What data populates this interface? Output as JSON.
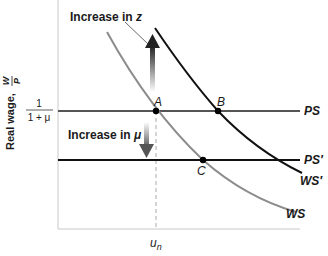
{
  "diagram": {
    "type": "wage-setting / price-setting equilibrium",
    "y_axis": {
      "label": "Real wage,",
      "fraction_num": "W",
      "fraction_den": "P"
    },
    "y_tick": {
      "num": "1",
      "den": "1 + μ"
    },
    "x_tick": {
      "main": "u",
      "sub": "n"
    },
    "curves": {
      "ps": "PS",
      "ps_prime": "PS′",
      "ws": "WS",
      "ws_prime": "WS′"
    },
    "points": {
      "a": "A",
      "b": "B",
      "c": "C"
    },
    "annotations": {
      "increase_z_text": "Increase in ",
      "increase_z_var": "z",
      "increase_mu_text": "Increase in ",
      "increase_mu_var": "μ"
    },
    "colors": {
      "ws_curve": "#8c8c8c",
      "ws_prime_curve": "#111111",
      "ps_line": "#555555",
      "ps_prime_line": "#111111",
      "axis": "#c8c8c8",
      "arrow": "#4a4a4a"
    }
  }
}
